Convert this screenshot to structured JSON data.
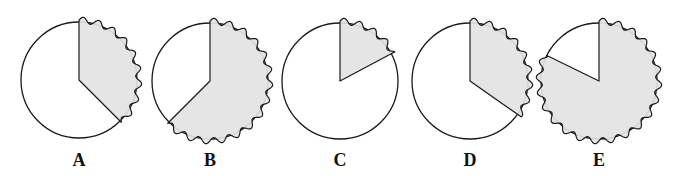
{
  "figure": {
    "colors": {
      "stroke": "#1a1a1a",
      "sector_fill": "#e3e3e3",
      "circle_fill": "#ffffff"
    },
    "radius": 58,
    "wave_amplitude": 3,
    "wave_count_per_full_circle": 24,
    "options": [
      {
        "label": "A",
        "cx": 79,
        "cy": 80,
        "start_deg": 0,
        "end_deg": 135
      },
      {
        "label": "B",
        "cx": 210,
        "cy": 81,
        "start_deg": 0,
        "end_deg": 225
      },
      {
        "label": "C",
        "cx": 340,
        "cy": 81,
        "start_deg": 0,
        "end_deg": 62
      },
      {
        "label": "D",
        "cx": 470,
        "cy": 81,
        "start_deg": 0,
        "end_deg": 125
      },
      {
        "label": "E",
        "cx": 599,
        "cy": 81,
        "start_deg": 0,
        "end_deg": 296
      }
    ],
    "label_y": 166
  }
}
